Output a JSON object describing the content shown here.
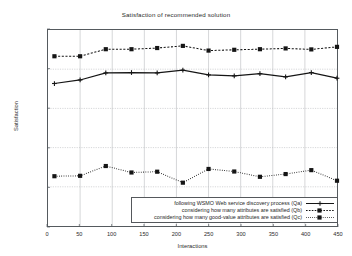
{
  "chart_data": {
    "type": "line",
    "title": "Satisfaction of recommended solution",
    "xlabel": "Interactions",
    "ylabel": "Satisfaction",
    "xlim": [
      0,
      450
    ],
    "ylim": [
      0,
      1
    ],
    "xticks": [
      0,
      50,
      100,
      150,
      200,
      250,
      300,
      350,
      400,
      450
    ],
    "yticks": [
      0,
      0.2,
      0.4,
      0.6,
      0.8,
      1
    ],
    "xtick_labels": [
      "0",
      "50",
      "100",
      "150",
      "200",
      "250",
      "300",
      "350",
      "400",
      "450"
    ],
    "ytick_labels": [
      "0",
      "0.2",
      "0.4",
      "0.6",
      "0.8",
      "1"
    ],
    "grid": true,
    "legend_position": "bottom-right-inside",
    "x": [
      10,
      50,
      90,
      130,
      170,
      210,
      250,
      290,
      330,
      370,
      410,
      450
    ],
    "series": [
      {
        "name": "following WSMO Web service discovery process (Qa)",
        "style": "solid",
        "color": "#151515",
        "marker": "plus",
        "values": [
          0.727,
          0.745,
          0.781,
          0.783,
          0.781,
          0.795,
          0.771,
          0.766,
          0.777,
          0.761,
          0.783,
          0.754
        ]
      },
      {
        "name": "considering how many attributes are satisfied (Qb)",
        "style": "dashed",
        "color": "#151515",
        "marker": "square",
        "values": [
          0.866,
          0.866,
          0.902,
          0.902,
          0.908,
          0.919,
          0.895,
          0.899,
          0.902,
          0.906,
          0.901,
          0.914
        ]
      },
      {
        "name": "considering how many good-value attributes are satisfied (Qc)",
        "style": "dotted",
        "color": "#151515",
        "marker": "square",
        "values": [
          0.254,
          0.256,
          0.306,
          0.273,
          0.277,
          0.221,
          0.291,
          0.278,
          0.251,
          0.265,
          0.285,
          0.231
        ]
      }
    ]
  }
}
